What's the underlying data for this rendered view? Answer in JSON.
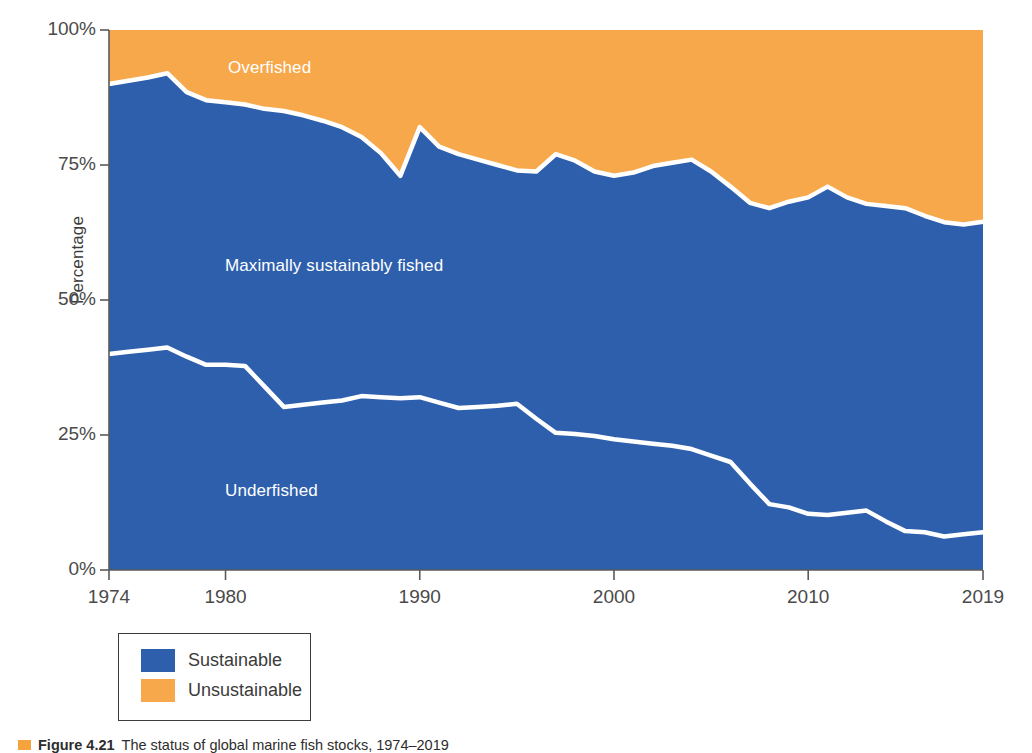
{
  "figure": {
    "caption_marker_color": "#F5A33C",
    "caption_label": "Figure 4.21",
    "caption_text": "The status of global marine fish stocks, 1974–2019"
  },
  "axes": {
    "ylabel": "Percentage",
    "yticks": [
      "100%",
      "75%",
      "50%",
      "25%",
      "0%"
    ],
    "ytick_values": [
      100,
      75,
      50,
      25,
      0
    ],
    "xticks": [
      "1974",
      "1980",
      "1990",
      "2000",
      "2010",
      "2019"
    ],
    "xtick_values": [
      1974,
      1980,
      1990,
      2000,
      2010,
      2019
    ]
  },
  "series_labels": [
    {
      "name": "overfished",
      "text": "Overfished",
      "color": "#ffffff"
    },
    {
      "name": "maximally-sustainably-fished",
      "text": "Maximally sustainably fished",
      "color": "#ffffff"
    },
    {
      "name": "underfished",
      "text": "Underfished",
      "color": "#ffffff"
    }
  ],
  "legend": {
    "items": [
      {
        "label": "Sustainable",
        "color": "#2E5FAC"
      },
      {
        "label": "Unsustainable",
        "color": "#F7A84A"
      }
    ]
  },
  "colors": {
    "sustainable": "#2E5FAC",
    "unsustainable": "#F7A84A",
    "boundary_line": "#ffffff",
    "axis": "#5a5a5a",
    "text": "#3b3b3b"
  },
  "chart_data": {
    "type": "area",
    "stacked": true,
    "title": "The status of global marine fish stocks, 1974–2019",
    "xlabel": "",
    "ylabel": "Percentage",
    "xlim": [
      1974,
      2019
    ],
    "ylim": [
      0,
      100
    ],
    "grid": false,
    "legend_position": "below-plot-left",
    "x": [
      1974,
      1975,
      1976,
      1977,
      1978,
      1979,
      1980,
      1981,
      1982,
      1983,
      1984,
      1985,
      1986,
      1987,
      1988,
      1989,
      1990,
      1991,
      1992,
      1993,
      1994,
      1995,
      1996,
      1997,
      1998,
      1999,
      2000,
      2001,
      2002,
      2003,
      2004,
      2005,
      2006,
      2007,
      2008,
      2009,
      2010,
      2011,
      2012,
      2013,
      2014,
      2015,
      2016,
      2017,
      2018,
      2019
    ],
    "series": [
      {
        "name": "Underfished",
        "color": "#2E5FAC",
        "values": [
          40.0,
          40.4,
          40.8,
          41.2,
          39.5,
          38.0,
          38.0,
          37.8,
          34.0,
          30.2,
          30.6,
          31.0,
          31.4,
          32.2,
          32.0,
          31.8,
          32.0,
          31.0,
          30.0,
          30.2,
          30.4,
          30.8,
          28.0,
          25.4,
          25.2,
          24.8,
          24.2,
          23.8,
          23.4,
          23.0,
          22.4,
          21.2,
          20.0,
          16.0,
          12.2,
          11.6,
          10.4,
          10.2,
          10.6,
          11.0,
          9.0,
          7.2,
          7.0,
          6.2,
          6.6,
          7.0
        ]
      },
      {
        "name": "Maximally sustainably fished",
        "color": "#2E5FAC",
        "values": [
          50.0,
          50.2,
          50.4,
          50.8,
          49.0,
          49.0,
          48.6,
          48.4,
          51.4,
          54.8,
          53.6,
          52.2,
          50.6,
          48.0,
          45.2,
          41.2,
          50.0,
          47.4,
          47.0,
          45.8,
          44.6,
          43.2,
          45.8,
          51.6,
          50.6,
          49.0,
          48.8,
          49.8,
          51.4,
          52.4,
          53.6,
          52.6,
          51.0,
          52.0,
          54.8,
          56.6,
          58.6,
          60.8,
          58.4,
          56.8,
          58.4,
          59.8,
          58.6,
          58.2,
          57.4,
          57.5
        ]
      },
      {
        "name": "Overfished",
        "color": "#F7A84A",
        "values": [
          10.0,
          9.4,
          8.8,
          8.0,
          11.5,
          13.0,
          13.4,
          13.8,
          14.6,
          15.0,
          15.8,
          16.8,
          18.0,
          19.8,
          22.8,
          27.0,
          18.0,
          21.6,
          23.0,
          24.0,
          25.0,
          26.0,
          26.2,
          23.0,
          24.2,
          26.2,
          27.0,
          26.4,
          25.2,
          24.6,
          24.0,
          26.2,
          29.0,
          32.0,
          33.0,
          31.8,
          31.0,
          29.0,
          31.0,
          32.2,
          32.6,
          33.0,
          34.4,
          35.6,
          36.0,
          35.5
        ]
      }
    ],
    "boundaries": {
      "underfished_top": [
        40.0,
        40.4,
        40.8,
        41.2,
        39.5,
        38.0,
        38.0,
        37.8,
        34.0,
        30.2,
        30.6,
        31.0,
        31.4,
        32.2,
        32.0,
        31.8,
        32.0,
        31.0,
        30.0,
        30.2,
        30.4,
        30.8,
        28.0,
        25.4,
        25.2,
        24.8,
        24.2,
        23.8,
        23.4,
        23.0,
        22.4,
        21.2,
        20.0,
        16.0,
        12.2,
        11.6,
        10.4,
        10.2,
        10.6,
        11.0,
        9.0,
        7.2,
        7.0,
        6.2,
        6.6,
        7.0
      ],
      "sustainable_top": [
        90.0,
        90.6,
        91.2,
        92.0,
        88.5,
        87.0,
        86.6,
        86.2,
        85.4,
        85.0,
        84.2,
        83.2,
        82.0,
        80.2,
        77.2,
        73.0,
        82.0,
        78.4,
        77.0,
        76.0,
        75.0,
        74.0,
        73.8,
        77.0,
        75.8,
        73.8,
        73.0,
        73.6,
        74.8,
        75.4,
        76.0,
        73.8,
        71.0,
        68.0,
        67.0,
        68.2,
        69.0,
        71.0,
        69.0,
        67.8,
        67.4,
        67.0,
        65.6,
        64.4,
        64.0,
        64.5
      ]
    }
  }
}
